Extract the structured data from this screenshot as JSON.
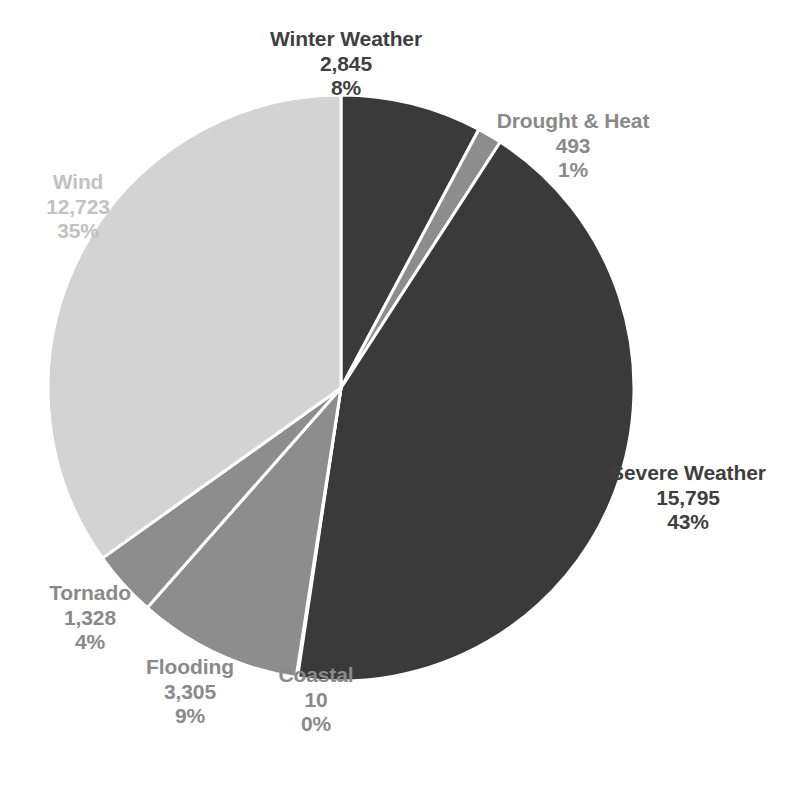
{
  "chart_data": {
    "type": "pie",
    "title": "",
    "subtitle": "",
    "xlabel": "",
    "ylabel": "",
    "legend_position": "none",
    "grid": false,
    "label_format": "name / value / percent",
    "total": 36499,
    "categories": [
      "Winter Weather",
      "Drought & Heat",
      "Severe Weather",
      "Coastal",
      "Flooding",
      "Tornado",
      "Wind"
    ],
    "values": [
      2845,
      493,
      15795,
      10,
      3305,
      1328,
      12723
    ],
    "value_labels": [
      "2,845",
      "493",
      "15,795",
      "10",
      "3,305",
      "1,328",
      "12,723"
    ],
    "percents": [
      8,
      1,
      43,
      0,
      9,
      4,
      35
    ],
    "percent_labels": [
      "8%",
      "1%",
      "43%",
      "0%",
      "9%",
      "4%",
      "35%"
    ],
    "slice_colors": [
      "#3a3a3a",
      "#8d8d8d",
      "#3a3a3a",
      "#8d8d8d",
      "#8d8d8d",
      "#8d8d8d",
      "#d3d3d3"
    ],
    "slices": [
      {
        "name": "Winter Weather",
        "value": 2845,
        "value_label": "2,845",
        "percent_label": "8%",
        "color": "#3a3a3a",
        "label_color": "#3f3f3f"
      },
      {
        "name": "Drought & Heat",
        "value": 493,
        "value_label": "493",
        "percent_label": "1%",
        "color": "#8d8d8d",
        "label_color": "#8a8a8a"
      },
      {
        "name": "Severe Weather",
        "value": 15795,
        "value_label": "15,795",
        "percent_label": "43%",
        "color": "#3a3a3a",
        "label_color": "#3f3f3f"
      },
      {
        "name": "Coastal",
        "value": 10,
        "value_label": "10",
        "percent_label": "0%",
        "color": "#8d8d8d",
        "label_color": "#8a8a8a"
      },
      {
        "name": "Flooding",
        "value": 3305,
        "value_label": "3,305",
        "percent_label": "9%",
        "color": "#8d8d8d",
        "label_color": "#8a8a8a"
      },
      {
        "name": "Tornado",
        "value": 1328,
        "value_label": "1,328",
        "percent_label": "4%",
        "color": "#8d8d8d",
        "label_color": "#8a8a8a"
      },
      {
        "name": "Wind",
        "value": 12723,
        "value_label": "12,723",
        "percent_label": "35%",
        "color": "#d3d3d3",
        "label_color": "#c2c2c2"
      }
    ],
    "geometry": {
      "center_x": 341,
      "center_y": 388,
      "radius": 293,
      "start_angle_deg": 0,
      "direction": "clockwise",
      "separator_color": "#ffffff",
      "separator_width": 3
    },
    "background_color": "#ffffff"
  }
}
